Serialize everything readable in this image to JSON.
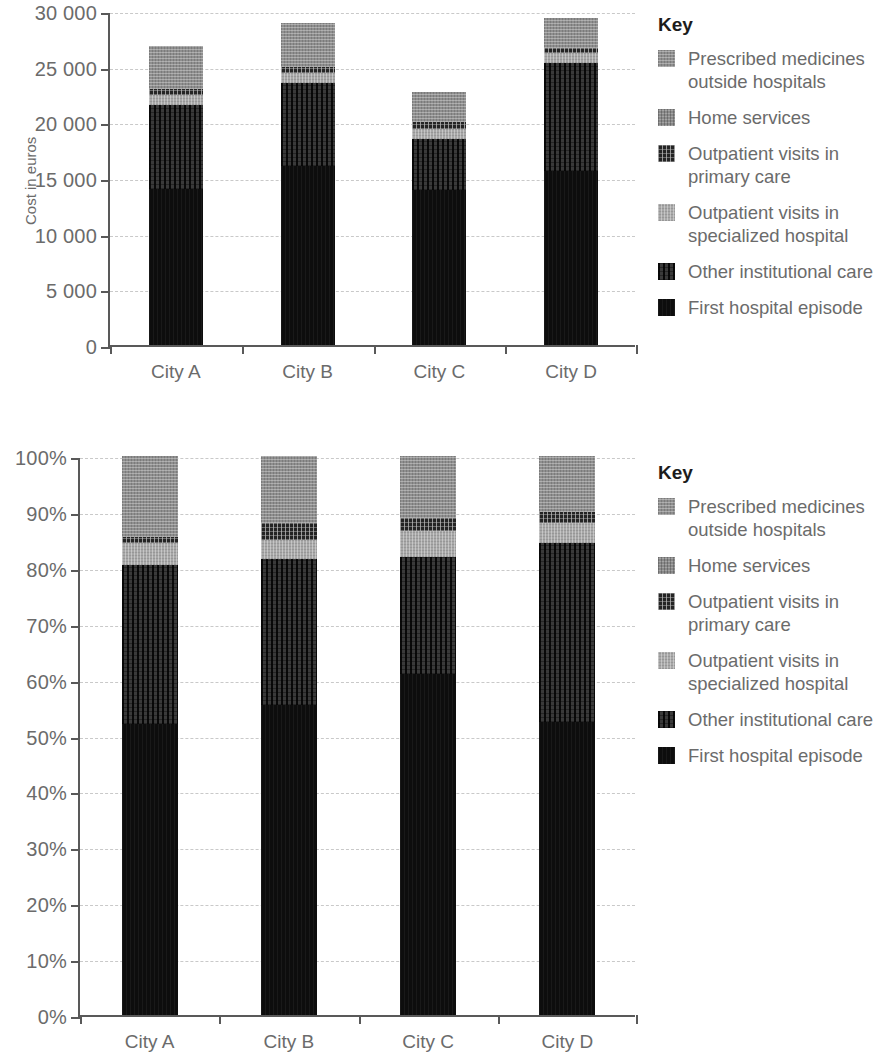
{
  "legend": {
    "title": "Key",
    "items": [
      {
        "label": "Prescribed medicines\noutside hospitals",
        "key": "presc",
        "color": "#8f8f8f"
      },
      {
        "label": "Home services",
        "key": "home",
        "color": "#8a8a8a"
      },
      {
        "label": "Outpatient visits in\nprimary care",
        "key": "outprim",
        "color": "#242424"
      },
      {
        "label": "Outpatient visits in\nspecialized hospital",
        "key": "outspec",
        "color": "#a8a8a8"
      },
      {
        "label": "Other institutional care",
        "key": "otherinst",
        "color": "#3a3a3a"
      },
      {
        "label": "First hospital episode",
        "key": "first",
        "color": "#0d0d0d"
      }
    ]
  },
  "chart_data": [
    {
      "type": "bar",
      "stacked": true,
      "title": "",
      "xlabel": "",
      "ylabel": "Cost in euros",
      "ylim": [
        0,
        30000
      ],
      "yticks": [
        0,
        5000,
        10000,
        15000,
        20000,
        25000,
        30000
      ],
      "ytick_labels": [
        "0",
        "5 000",
        "10 000",
        "15 000",
        "20 000",
        "25 000",
        "30 000"
      ],
      "grid": true,
      "legend_position": "right",
      "categories": [
        "City A",
        "City B",
        "City C",
        "City D"
      ],
      "series": [
        {
          "name": "First hospital episode",
          "key": "first",
          "values": [
            14000,
            16100,
            13900,
            15600
          ]
        },
        {
          "name": "Other institutional care",
          "key": "otherinst",
          "values": [
            7600,
            7400,
            4600,
            9700
          ]
        },
        {
          "name": "Outpatient visits in specialized hospital",
          "key": "outspec",
          "values": [
            900,
            900,
            900,
            900
          ]
        },
        {
          "name": "Outpatient visits in primary care",
          "key": "outprim",
          "values": [
            500,
            600,
            600,
            500
          ]
        },
        {
          "name": "Home services",
          "key": "home",
          "values": [
            0,
            0,
            0,
            0
          ]
        },
        {
          "name": "Prescribed medicines outside hospitals",
          "key": "presc",
          "values": [
            3900,
            3900,
            2700,
            2700
          ]
        }
      ],
      "totals": [
        26900,
        28900,
        22700,
        29400
      ]
    },
    {
      "type": "bar",
      "stacked": true,
      "title": "",
      "xlabel": "",
      "ylabel": "",
      "ylim": [
        0,
        100
      ],
      "yticks": [
        0,
        10,
        20,
        30,
        40,
        50,
        60,
        70,
        80,
        90,
        100
      ],
      "ytick_labels": [
        "0%",
        "10%",
        "20%",
        "30%",
        "40%",
        "50%",
        "60%",
        "70%",
        "80%",
        "90%",
        "100%"
      ],
      "grid": true,
      "legend_position": "right",
      "categories": [
        "City A",
        "City B",
        "City C",
        "City D"
      ],
      "series": [
        {
          "name": "First hospital episode",
          "key": "first",
          "values": [
            52.0,
            55.5,
            61.0,
            52.5
          ]
        },
        {
          "name": "Other institutional care",
          "key": "otherinst",
          "values": [
            28.5,
            26.0,
            21.0,
            32.0
          ]
        },
        {
          "name": "Outpatient visits in specialized hospital",
          "key": "outspec",
          "values": [
            4.0,
            3.5,
            4.5,
            3.5
          ]
        },
        {
          "name": "Outpatient visits in primary care",
          "key": "outprim",
          "values": [
            1.0,
            3.0,
            2.5,
            2.0
          ]
        },
        {
          "name": "Home services",
          "key": "home",
          "values": [
            0,
            0,
            0,
            0
          ]
        },
        {
          "name": "Prescribed medicines outside hospitals",
          "key": "presc",
          "values": [
            14.5,
            12.0,
            11.0,
            10.0
          ]
        }
      ],
      "totals": [
        100,
        100,
        100,
        100
      ]
    }
  ]
}
